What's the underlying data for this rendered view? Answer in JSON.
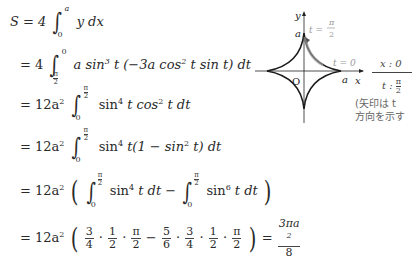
{
  "derivation": {
    "lines": [
      {
        "lhs": "S = 4",
        "int_upper": "a",
        "int_lower": "0",
        "integrand": "y dx"
      },
      {
        "lhs": "= 4",
        "int_upper": "0",
        "int_lower": "π/2",
        "integrand": "a sin³ t (−3a cos² t sin t) dt"
      },
      {
        "lhs": "= 12a²",
        "int_upper": "π/2",
        "int_lower": "0",
        "integrand": "sin⁴ t cos² t dt"
      },
      {
        "lhs": "= 12a²",
        "int_upper": "π/2",
        "int_lower": "0",
        "integrand": "sin⁴ t(1 − sin² t) dt"
      },
      {
        "lhs": "= 12a²",
        "integrand_a": "sin⁴ t dt",
        "integrand_b": "sin⁶ t dt",
        "int_upper": "π/2",
        "int_lower": "0"
      },
      {
        "lhs": "= 12a²",
        "result": "3πa²/8"
      }
    ],
    "line1": {
      "prefix": "S = 4",
      "upper": "a",
      "lower": "0",
      "body": "y dx"
    },
    "line2": {
      "prefix": "= 4",
      "upper": "0",
      "lower_num": "π",
      "lower_den": "2",
      "body": "a sin",
      "exp1": "3",
      "body2": " t (−3a cos",
      "exp2": "2",
      "body3": " t sin t) dt"
    },
    "line3": {
      "prefix": "= 12a",
      "pexp": "2",
      "upper_num": "π",
      "upper_den": "2",
      "lower": "0",
      "b1": "sin",
      "e1": "4",
      "b2": " t cos",
      "e2": "2",
      "b3": " t dt"
    },
    "line4": {
      "prefix": "= 12a",
      "pexp": "2",
      "upper_num": "π",
      "upper_den": "2",
      "lower": "0",
      "b1": "sin",
      "e1": "4",
      "b2": " t(1 − sin",
      "e2": "2",
      "b3": " t) dt"
    },
    "line5": {
      "prefix": "= 12a",
      "pexp": "2",
      "upper_num": "π",
      "upper_den": "2",
      "lower": "0",
      "b1": "sin",
      "e1": "4",
      "b2": " t dt − ",
      "c1": "sin",
      "ce1": "6",
      "c2": " t dt"
    },
    "line6": {
      "prefix": "= 12a",
      "pexp": "2",
      "fracs": [
        [
          "3",
          "4"
        ],
        [
          "1",
          "2"
        ],
        [
          "π",
          "2"
        ],
        [
          "5",
          "6"
        ],
        [
          "3",
          "4"
        ],
        [
          "1",
          "2"
        ],
        [
          "π",
          "2"
        ]
      ],
      "minus": "−",
      "dot": "·",
      "equals": "=",
      "result_num": "3πa",
      "result_exp": "2",
      "result_den": "8"
    }
  },
  "diagram": {
    "axis_x": "x",
    "axis_y": "y",
    "origin": "O",
    "label_a_top": "a",
    "label_a_right": "a",
    "t_top": "t =",
    "t_top_num": "π",
    "t_top_den": "2",
    "t_right": "t = 0",
    "curve_color": "#1a1a1a",
    "highlight_color": "#999999",
    "label_color": "#999999"
  },
  "side_table": {
    "row1": "x : 0",
    "row2_prefix": "t : ",
    "row2_num": "π",
    "row2_den": "2",
    "note_line1": "(矢印は t",
    "note_line2": "方向を示す"
  }
}
